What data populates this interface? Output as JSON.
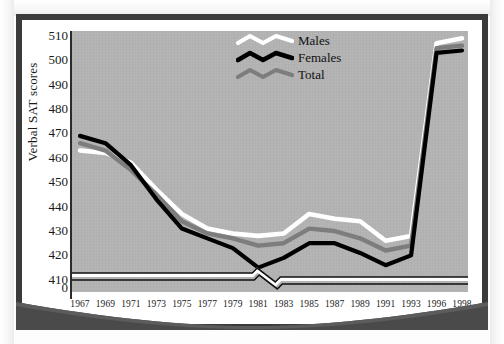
{
  "figure": {
    "background_color": "#b3b3b3",
    "frame_color": "#3a3a3a",
    "page_color": "#ffffff"
  },
  "chart_data": {
    "type": "line",
    "title": "",
    "subtitle": "",
    "xlabel": "",
    "ylabel": "Verbal SAT scores",
    "ylim": [
      405,
      512
    ],
    "y_ticks": [
      410,
      420,
      430,
      440,
      450,
      460,
      470,
      480,
      490,
      500,
      510
    ],
    "y_zero_tick": "0",
    "y_axis_break": true,
    "x_axis_break": true,
    "grid": false,
    "legend_position": "upper-right-inside",
    "categories": [
      "1967",
      "1969",
      "1971",
      "1973",
      "1975",
      "1977",
      "1979",
      "1981",
      "1983",
      "1985",
      "1987",
      "1989",
      "1991",
      "1993",
      "1996",
      "1998"
    ],
    "series": [
      {
        "name": "Males",
        "color": "#ffffff",
        "values": [
          463,
          462,
          458,
          447,
          437,
          431,
          429,
          428,
          429,
          437,
          435,
          434,
          426,
          428,
          507,
          509
        ]
      },
      {
        "name": "Females",
        "color": "#000000",
        "values": [
          469,
          466,
          457,
          443,
          431,
          427,
          423,
          415,
          419,
          425,
          425,
          421,
          416,
          420,
          503,
          504
        ]
      },
      {
        "name": "Total",
        "color": "#7d7d7d",
        "values": [
          466,
          463,
          455,
          445,
          434,
          429,
          427,
          424,
          425,
          431,
          430,
          427,
          422,
          424,
          505,
          506
        ]
      }
    ]
  },
  "legend": {
    "items": [
      {
        "label": "Males",
        "color": "#ffffff"
      },
      {
        "label": "Females",
        "color": "#000000"
      },
      {
        "label": "Total",
        "color": "#7d7d7d"
      }
    ]
  },
  "axis": {
    "y_title": "Verbal SAT scores",
    "zero_label": "0"
  }
}
